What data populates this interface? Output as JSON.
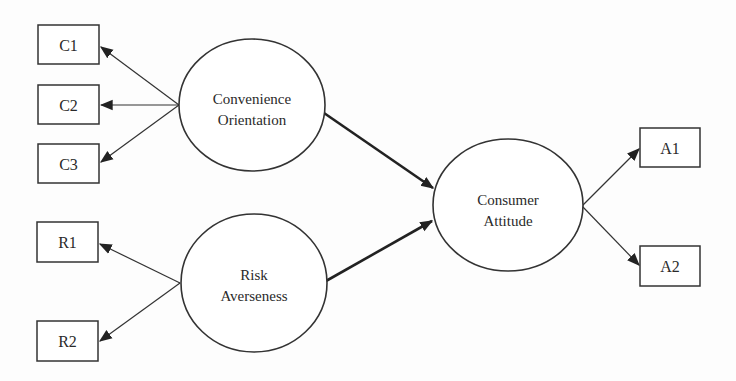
{
  "diagram": {
    "type": "structural-equation-model",
    "latent_constructs": [
      {
        "id": "convenience",
        "line1": "Convenience",
        "line2": "Orientation"
      },
      {
        "id": "risk",
        "line1": "Risk",
        "line2": "Averseness"
      },
      {
        "id": "attitude",
        "line1": "Consumer",
        "line2": "Attitude"
      }
    ],
    "indicators": {
      "convenience": [
        "C1",
        "C2",
        "C3"
      ],
      "risk": [
        "R1",
        "R2"
      ],
      "attitude": [
        "A1",
        "A2"
      ]
    },
    "paths": [
      {
        "from": "Convenience Orientation",
        "to": "Consumer Attitude"
      },
      {
        "from": "Risk Averseness",
        "to": "Consumer Attitude"
      }
    ],
    "colors": {
      "line": "#333333",
      "background": "#fdfdfd",
      "text": "#2a2a2a"
    }
  }
}
